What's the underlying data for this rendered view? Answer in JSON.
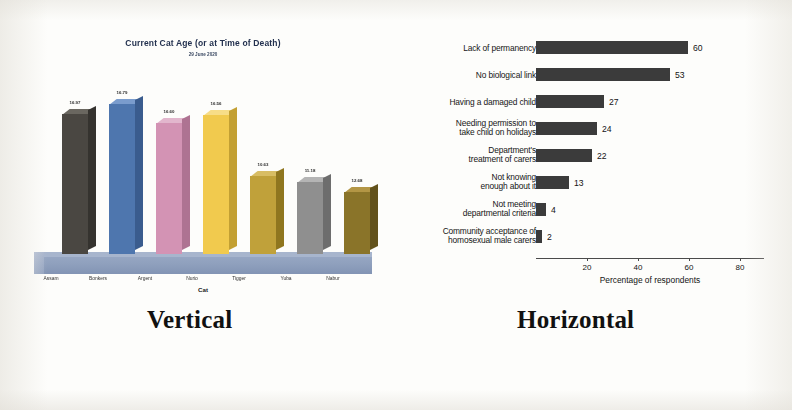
{
  "figure": {
    "caption_left": "Vertical",
    "caption_right": "Horizontal"
  },
  "chart_data": [
    {
      "id": "vertical-column-chart",
      "type": "bar",
      "orientation": "vertical",
      "title": "Current Cat Age (or at Time of Death)",
      "subtitle": "29 June 2020",
      "xlabel": "Cat",
      "ylabel": "",
      "ylim": [
        0,
        20
      ],
      "grid": false,
      "legend": "none",
      "style": "3d-column",
      "categories": [
        "Assam",
        "Bonkers",
        "Argent",
        "Nurio",
        "Tigger",
        "Yuba",
        "Nabur"
      ],
      "values": [
        16.97,
        16.79,
        16.6,
        16.56,
        10.63,
        11.18,
        12.68
      ],
      "value_labels": [
        "16.97",
        "16.79",
        "16.60",
        "16.56",
        "10.63",
        "11.18",
        "12.68"
      ],
      "colors": [
        "#4a4742",
        "#4e76ae",
        "#d393b4",
        "#f1ca4e",
        "#c0a13a",
        "#8f8f8f",
        "#8a7429"
      ]
    },
    {
      "id": "horizontal-bar-chart",
      "type": "bar",
      "orientation": "horizontal",
      "title": "",
      "xlabel": "Percentage of respondents",
      "ylabel": "",
      "xlim": [
        0,
        90
      ],
      "xticks": [
        20,
        40,
        60,
        80
      ],
      "grid": false,
      "legend": "none",
      "bar_color": "#3b3b3b",
      "categories": [
        "Lack of permanency",
        "No biological link",
        "Having a damaged child",
        "Needing permission to\ntake child on holidays",
        "Department's\ntreatment of carers",
        "Not knowing\nenough about it",
        "Not meeting\ndepartmental criteria",
        "Community acceptance of\nhomosexual male carers"
      ],
      "values": [
        60,
        53,
        27,
        24,
        22,
        13,
        4,
        2
      ],
      "value_labels": [
        "60",
        "53",
        "27",
        "24",
        "22",
        "13",
        "4",
        "2"
      ]
    }
  ]
}
